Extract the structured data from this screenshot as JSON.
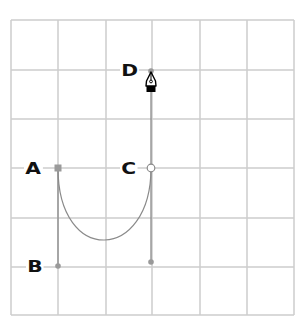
{
  "diagram": {
    "type": "bezier-pen-tool-illustration",
    "grid": {
      "columns": 6,
      "rows": 6,
      "x_lines": [
        11,
        58,
        106,
        152,
        200,
        247,
        294
      ],
      "y_lines": [
        20,
        70,
        119,
        168,
        218,
        267,
        315
      ],
      "color": "#cccccc"
    },
    "colors": {
      "path": "#8a8a8a",
      "handle": "#8a8a8a",
      "anchor_fill": "#9a9a9a",
      "label": "#111111",
      "background": "#ffffff"
    },
    "points": [
      {
        "id": "A",
        "label": "A",
        "x": 58,
        "y": 168,
        "kind": "anchor-square"
      },
      {
        "id": "B",
        "label": "B",
        "x": 58,
        "y": 266,
        "kind": "handle-dot"
      },
      {
        "id": "C",
        "label": "C",
        "x": 151,
        "y": 168,
        "kind": "anchor-open-circle"
      },
      {
        "id": "D",
        "label": "D",
        "x": 151,
        "y": 71,
        "kind": "handle-dot"
      },
      {
        "id": "C2",
        "label": "",
        "x": 151,
        "y": 262,
        "kind": "handle-dot"
      }
    ],
    "labels": [
      {
        "text": "A",
        "x": 24,
        "y": 162
      },
      {
        "text": "B",
        "x": 26,
        "y": 260
      },
      {
        "text": "C",
        "x": 120,
        "y": 162
      },
      {
        "text": "D",
        "x": 120,
        "y": 64
      }
    ],
    "curve": {
      "from": "A",
      "to": "C",
      "c1": [
        58,
        266
      ],
      "c2": [
        151,
        262
      ]
    },
    "handles": [
      [
        "A",
        "B"
      ],
      [
        "C",
        "C2"
      ],
      [
        "C",
        "D"
      ]
    ],
    "cursor": {
      "name": "pen-tool-cursor",
      "x": 151,
      "y": 72
    }
  }
}
